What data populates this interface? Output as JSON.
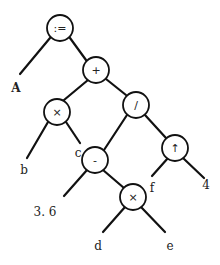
{
  "diagram": {
    "type": "expression-tree",
    "expression": "A := b × c + (3.6 - d × e) / f ↑ 4",
    "nodes": [
      {
        "id": "assign",
        "label": ":=",
        "x": 60,
        "y": 28
      },
      {
        "id": "plus",
        "label": "+",
        "x": 96,
        "y": 70
      },
      {
        "id": "times1",
        "label": "×",
        "x": 57,
        "y": 112
      },
      {
        "id": "divide",
        "label": "/",
        "x": 136,
        "y": 105
      },
      {
        "id": "minus",
        "label": "-",
        "x": 95,
        "y": 160
      },
      {
        "id": "power",
        "label": "↑",
        "x": 175,
        "y": 148
      },
      {
        "id": "times2",
        "label": "×",
        "x": 133,
        "y": 197
      }
    ],
    "leaves": [
      {
        "id": "A",
        "label": "A",
        "x": 16,
        "y": 88,
        "bold": true
      },
      {
        "id": "b",
        "label": "b",
        "x": 24,
        "y": 170
      },
      {
        "id": "c",
        "label": "c",
        "x": 78,
        "y": 153
      },
      {
        "id": "n36",
        "label": "3. 6",
        "x": 45,
        "y": 212
      },
      {
        "id": "d",
        "label": "d",
        "x": 98,
        "y": 246
      },
      {
        "id": "e",
        "label": "e",
        "x": 170,
        "y": 246
      },
      {
        "id": "f",
        "label": "f",
        "x": 152,
        "y": 188
      },
      {
        "id": "n4",
        "label": "4",
        "x": 206,
        "y": 185
      }
    ],
    "edges": [
      {
        "from": [
          50,
          38
        ],
        "to": [
          20,
          74
        ]
      },
      {
        "from": [
          70,
          38
        ],
        "to": [
          86,
          60
        ]
      },
      {
        "from": [
          88,
          80
        ],
        "to": [
          64,
          100
        ]
      },
      {
        "from": [
          106,
          79
        ],
        "to": [
          126,
          95
        ]
      },
      {
        "from": [
          48,
          122
        ],
        "to": [
          27,
          158
        ]
      },
      {
        "from": [
          66,
          122
        ],
        "to": [
          80,
          143
        ]
      },
      {
        "from": [
          127,
          115
        ],
        "to": [
          104,
          150
        ]
      },
      {
        "from": [
          145,
          115
        ],
        "to": [
          166,
          138
        ]
      },
      {
        "from": [
          87,
          170
        ],
        "to": [
          64,
          196
        ]
      },
      {
        "from": [
          103,
          170
        ],
        "to": [
          124,
          188
        ]
      },
      {
        "from": [
          168,
          158
        ],
        "to": [
          152,
          176
        ]
      },
      {
        "from": [
          183,
          158
        ],
        "to": [
          204,
          178
        ]
      },
      {
        "from": [
          125,
          207
        ],
        "to": [
          103,
          232
        ]
      },
      {
        "from": [
          141,
          207
        ],
        "to": [
          165,
          232
        ]
      }
    ],
    "node_radius": 13,
    "colors": {
      "stroke": "#111111",
      "fill": "#ffffff",
      "text": "#222222"
    }
  }
}
